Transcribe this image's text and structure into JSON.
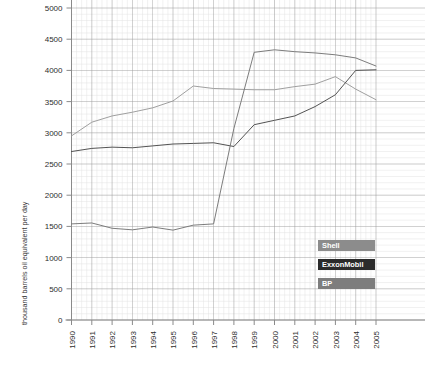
{
  "chart_data": {
    "type": "line",
    "title": "",
    "subtitle": "",
    "xlabel": "",
    "ylabel": "thousand barrels oil equivalent per day",
    "x": [
      1990,
      1991,
      1992,
      1993,
      1994,
      1995,
      1996,
      1997,
      1998,
      1999,
      2000,
      2001,
      2002,
      2003,
      2004,
      2005
    ],
    "categories": [
      "1990",
      "1991",
      "1992",
      "1993",
      "1994",
      "1995",
      "1996",
      "1997",
      "1998",
      "1999",
      "2000",
      "2001",
      "2002",
      "2003",
      "2004",
      "2005"
    ],
    "ylim": [
      0,
      5000
    ],
    "xlim": [
      1990,
      2005
    ],
    "ytick_labels": [
      "0",
      "500",
      "1000",
      "1500",
      "2000",
      "2500",
      "3000",
      "3500",
      "4000",
      "4500",
      "5000"
    ],
    "ytick_values": [
      0,
      500,
      1000,
      1500,
      2000,
      2500,
      3000,
      3500,
      4000,
      4500,
      5000
    ],
    "ytick_step": 500,
    "grid": true,
    "minor_grid": true,
    "legend_position": "bottom-right",
    "series": [
      {
        "name": "Shell",
        "color": "#9a9a9a",
        "legend_bg": "#8c8c8c",
        "legend_fg": "#ffffff",
        "values": [
          2950,
          3170,
          3270,
          3330,
          3400,
          3510,
          3750,
          3710,
          3700,
          3690,
          3690,
          3740,
          3780,
          3900,
          3700,
          3530
        ]
      },
      {
        "name": "ExxonMobil",
        "color": "#4a4a4a",
        "legend_bg": "#2b2b2b",
        "legend_fg": "#ffffff",
        "values": [
          2700,
          2750,
          2770,
          2760,
          2790,
          2820,
          2830,
          2840,
          2780,
          3130,
          3200,
          3270,
          3420,
          3610,
          4000,
          4010
        ]
      },
      {
        "name": "BP",
        "color": "#757575",
        "legend_bg": "#7d7d7d",
        "legend_fg": "#ffffff",
        "values": [
          1540,
          1555,
          1470,
          1445,
          1490,
          1440,
          1520,
          1540,
          3070,
          4290,
          4330,
          4300,
          4280,
          4250,
          4200,
          4070
        ]
      }
    ],
    "legend_entries": [
      {
        "label": "Shell",
        "swatch": "#8c8c8c"
      },
      {
        "label": "ExxonMobil",
        "swatch": "#2b2b2b"
      },
      {
        "label": "BP",
        "swatch": "#7d7d7d"
      }
    ]
  },
  "colors": {
    "background": "#ffffff",
    "axis": "#9b9b9b",
    "grid_major": "#9b9b9b",
    "grid_minor": "#e2e2e2",
    "tick_text": "#2e2e2e"
  }
}
